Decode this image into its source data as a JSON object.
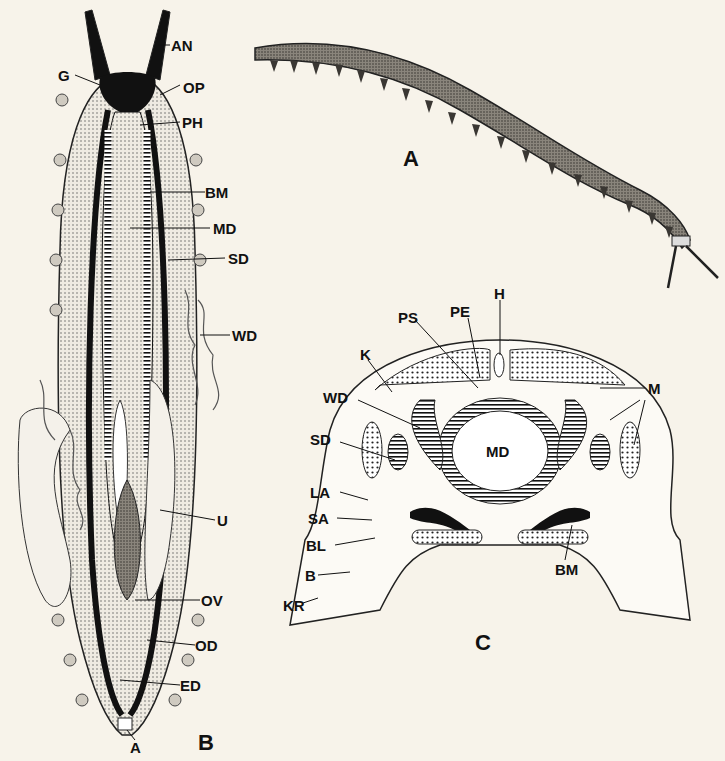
{
  "figure": {
    "panels": [
      {
        "id": "A",
        "caption": "A",
        "description": "whole animal, lateral view"
      },
      {
        "id": "B",
        "caption": "B",
        "description": "dorsal dissection, internal anatomy"
      },
      {
        "id": "C",
        "caption": "C",
        "description": "transverse cross-section"
      }
    ],
    "panel_b_labels": {
      "AN": "AN",
      "G": "G",
      "OP": "OP",
      "PH": "PH",
      "BM": "BM",
      "MD": "MD",
      "SD": "SD",
      "WD": "WD",
      "U": "U",
      "OV": "OV",
      "OD": "OD",
      "ED": "ED",
      "A": "A"
    },
    "panel_c_labels": {
      "H": "H",
      "PE": "PE",
      "PS": "PS",
      "K": "K",
      "WD": "WD",
      "M": "M",
      "SD": "SD",
      "MD": "MD",
      "LA": "LA",
      "SA": "SA",
      "BL": "BL",
      "B": "B",
      "BM": "BM",
      "KR": "KR"
    },
    "colors": {
      "background": "#f7f3ea",
      "ink": "#111111",
      "stipple": "#cfcac0"
    }
  }
}
